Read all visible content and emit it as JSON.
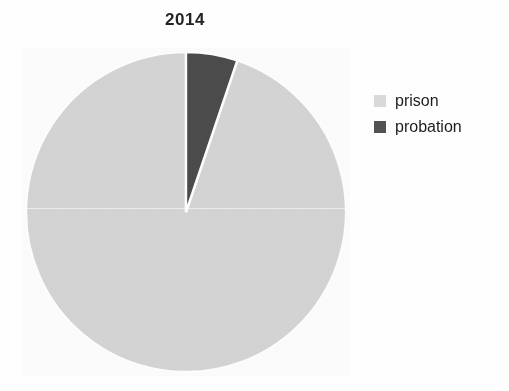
{
  "chart_data": {
    "type": "pie",
    "title": "2014",
    "categories": [
      "prison",
      "probation"
    ],
    "values": [
      94.8,
      5.2
    ],
    "value_unit": "percent",
    "colors": [
      "#d6d6d6",
      "#4c4c4c"
    ],
    "start_angle_deg": 90,
    "direction": "counterclockwise",
    "slice_separator_color": "#ffffff",
    "legend_position": "right",
    "xlabel": "",
    "ylabel": "",
    "grid": false,
    "slices": [
      {
        "label": "prison",
        "value": 94.8,
        "color": "#d6d6d6",
        "angle_deg": 341.3
      },
      {
        "label": "probation",
        "value": 5.2,
        "color": "#4c4c4c",
        "angle_deg": 18.7
      }
    ]
  },
  "legend": {
    "items": [
      {
        "label": "prison",
        "swatch_color": "#d9d9d9",
        "icon": "legend-swatch-icon"
      },
      {
        "label": "probation",
        "swatch_color": "#525252",
        "icon": "legend-swatch-icon"
      }
    ]
  },
  "figure": {
    "background": "#ffffff",
    "title_color": "#242424"
  }
}
